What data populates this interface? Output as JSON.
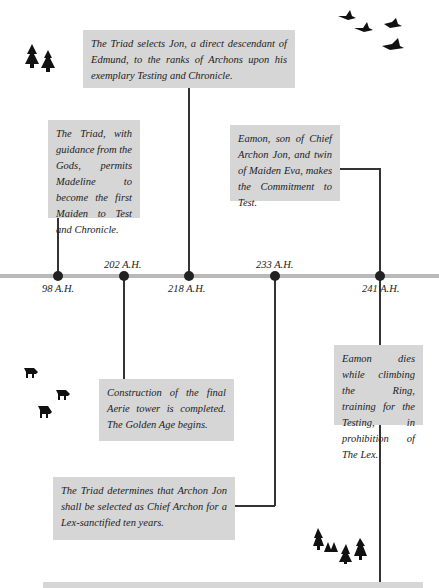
{
  "timeline": {
    "events": [
      {
        "date": "98 A.H.",
        "text": "The Triad, with guidance from the Gods, permits Madeline to become the first Maiden to Test and Chronicle."
      },
      {
        "date": "202 A.H.",
        "text": "Construction of the final Aerie tower is completed. The Golden Age begins."
      },
      {
        "date": "218 A.H.",
        "text": "The Triad selects Jon, a direct descendant of Edmund, to the ranks of Archons upon his exemplary Testing and Chronicle."
      },
      {
        "date": "233 A.H.",
        "text": "The Triad determines that Archon Jon shall be selected as Chief Archon for a Lex-sanctified ten years."
      },
      {
        "date": "241 A.H.",
        "text": "Eamon, son of Chief Archon Jon, and twin of Maiden Eva, makes the Commitment to Test."
      },
      {
        "date": "",
        "text": "Eamon dies while climbing the Ring, training for the Testing, in prohibition of The Lex."
      }
    ]
  },
  "decorations": {
    "icons": [
      "tree-pair-icon",
      "flying-geese-icon",
      "boar-herd-icon",
      "tree-cluster-icon"
    ]
  },
  "colors": {
    "box_bg": "#d6d6d6",
    "timeline": "#b9b9b9",
    "ink": "#222222"
  }
}
